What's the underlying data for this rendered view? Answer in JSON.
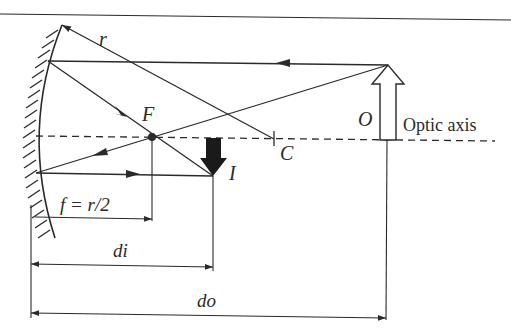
{
  "figure": {
    "labels": {
      "radius": "r",
      "focal_point": "F",
      "center_of_curvature": "C",
      "object": "O",
      "image": "I",
      "optic_axis": "Optic axis",
      "focal_length": "f = r/2",
      "image_distance": "di",
      "object_distance": "do"
    },
    "colors": {
      "ink": "#2a2a2a",
      "background": "#ffffff"
    }
  }
}
